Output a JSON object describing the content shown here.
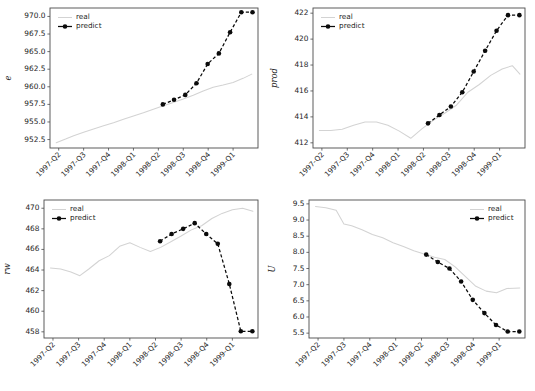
{
  "figure": {
    "background_color": "#ffffff",
    "real_color": "#d3d3d3",
    "predict_color": "#0b0b0b",
    "panel_count": 4
  },
  "legend": {
    "real_label": "real",
    "predict_label": "predict"
  },
  "chart_data": [
    {
      "id": "e",
      "type": "line",
      "title": "",
      "xlabel": "",
      "ylabel": "e",
      "grid": false,
      "legend_position": "upper left",
      "x": [
        "1997-Q2",
        "1997-Q3",
        "1997-Q4",
        "1998-Q1",
        "1998-Q2",
        "1998-Q3",
        "1998-Q4",
        "1999-Q1"
      ],
      "xtick_labels": [
        "1997-Q2",
        "1997-Q3",
        "1997-Q4",
        "1998-Q1",
        "1998-Q2",
        "1998-Q3",
        "1998-Q4",
        "1999-Q1"
      ],
      "ytick_labels": [
        "952.5",
        "955.0",
        "957.5",
        "960.0",
        "962.5",
        "965.0",
        "967.5",
        "970.0"
      ],
      "yticks": [
        952.5,
        955.0,
        957.5,
        960.0,
        962.5,
        965.0,
        967.5,
        970.0
      ],
      "ylim": [
        951.3,
        971.2
      ],
      "xlim": [
        -0.35,
        8.0
      ],
      "series": [
        {
          "name": "real",
          "style": "solid",
          "markers": false,
          "x": [
            -0.1,
            0.3,
            0.6,
            1.0,
            1.4,
            1.8,
            2.2,
            2.6,
            3.0,
            3.4,
            3.8,
            4.2,
            4.6,
            5.0,
            5.4,
            5.8,
            6.2,
            6.6,
            7.0,
            7.4,
            7.75
          ],
          "values": [
            952.05,
            952.6,
            953.05,
            953.55,
            954.0,
            954.45,
            954.9,
            955.4,
            955.85,
            956.3,
            956.8,
            957.3,
            957.75,
            958.25,
            958.8,
            959.4,
            959.95,
            960.25,
            960.6,
            961.2,
            961.8
          ]
        },
        {
          "name": "predict",
          "style": "dashed",
          "markers": true,
          "x": [
            4.18,
            4.63,
            5.08,
            5.53,
            5.98,
            6.43,
            6.88,
            7.33,
            7.78
          ],
          "values": [
            957.5,
            958.15,
            958.85,
            960.5,
            963.25,
            964.75,
            967.75,
            970.6,
            970.6
          ]
        }
      ]
    },
    {
      "id": "prod",
      "type": "line",
      "title": "",
      "xlabel": "",
      "ylabel": "prod",
      "grid": false,
      "legend_position": "upper left",
      "x": [
        "1997-Q2",
        "1997-Q3",
        "1997-Q4",
        "1998-Q1",
        "1998-Q2",
        "1998-Q3",
        "1998-Q4",
        "1999-Q1"
      ],
      "xtick_labels": [
        "1997-Q2",
        "1997-Q3",
        "1997-Q4",
        "1998-Q1",
        "1998-Q2",
        "1998-Q3",
        "1998-Q4",
        "1999-Q1"
      ],
      "ytick_labels": [
        "412",
        "414",
        "416",
        "418",
        "420",
        "422"
      ],
      "yticks": [
        412,
        414,
        416,
        418,
        420,
        422
      ],
      "ylim": [
        411.6,
        422.4
      ],
      "xlim": [
        -0.35,
        8.0
      ],
      "series": [
        {
          "name": "real",
          "style": "solid",
          "markers": false,
          "x": [
            -0.1,
            0.35,
            0.8,
            1.25,
            1.7,
            2.15,
            2.6,
            3.05,
            3.5,
            3.95,
            4.4,
            4.85,
            5.3,
            5.75,
            6.2,
            6.65,
            7.1,
            7.5,
            7.8
          ],
          "values": [
            412.95,
            412.95,
            413.05,
            413.35,
            413.6,
            413.6,
            413.35,
            412.9,
            412.35,
            413.1,
            413.75,
            414.3,
            414.9,
            415.9,
            416.5,
            417.2,
            417.7,
            417.95,
            417.3
          ]
        },
        {
          "name": "predict",
          "style": "dashed",
          "markers": true,
          "x": [
            4.18,
            4.63,
            5.08,
            5.53,
            5.98,
            6.43,
            6.88,
            7.33,
            7.78
          ],
          "values": [
            413.5,
            414.15,
            414.8,
            415.9,
            417.5,
            419.1,
            420.65,
            421.85,
            421.85
          ]
        }
      ]
    },
    {
      "id": "rw",
      "type": "line",
      "title": "",
      "xlabel": "",
      "ylabel": "rw",
      "grid": false,
      "legend_position": "upper left",
      "x": [
        "1997-Q2",
        "1997-Q3",
        "1997-Q4",
        "1998-Q1",
        "1998-Q2",
        "1998-Q3",
        "1998-Q4",
        "1999-Q1"
      ],
      "xtick_labels": [
        "1997-Q2",
        "1997-Q3",
        "1997-Q4",
        "1998-Q1",
        "1998-Q2",
        "1998-Q3",
        "1998-Q4",
        "1999-Q1"
      ],
      "ytick_labels": [
        "458",
        "460",
        "462",
        "464",
        "466",
        "468",
        "470"
      ],
      "yticks": [
        458,
        460,
        462,
        464,
        466,
        468,
        470
      ],
      "ylim": [
        457.4,
        470.8
      ],
      "xlim": [
        -0.35,
        8.0
      ],
      "series": [
        {
          "name": "real",
          "style": "solid",
          "markers": false,
          "x": [
            -0.1,
            0.3,
            0.7,
            1.05,
            1.4,
            1.8,
            2.2,
            2.6,
            3.0,
            3.4,
            3.8,
            4.2,
            4.6,
            5.0,
            5.4,
            5.8,
            6.2,
            6.6,
            7.0,
            7.4,
            7.8
          ],
          "values": [
            464.2,
            464.1,
            463.8,
            463.45,
            464.1,
            464.9,
            465.4,
            466.3,
            466.65,
            466.2,
            465.8,
            466.2,
            466.75,
            467.3,
            467.9,
            468.3,
            469.0,
            469.5,
            469.85,
            470.0,
            469.7
          ]
        },
        {
          "name": "predict",
          "style": "dashed",
          "markers": true,
          "x": [
            4.18,
            4.63,
            5.08,
            5.53,
            5.98,
            6.43,
            6.88,
            7.33,
            7.78
          ],
          "values": [
            466.8,
            467.5,
            468.0,
            468.55,
            467.5,
            466.55,
            462.65,
            458.05,
            458.05
          ]
        }
      ]
    },
    {
      "id": "U",
      "type": "line",
      "title": "",
      "xlabel": "",
      "ylabel": "U",
      "grid": false,
      "legend_position": "upper right",
      "x": [
        "1997-Q2",
        "1997-Q3",
        "1997-Q4",
        "1998-Q1",
        "1998-Q2",
        "1998-Q3",
        "1998-Q4",
        "1999-Q1"
      ],
      "xtick_labels": [
        "1997-Q2",
        "1997-Q3",
        "1997-Q4",
        "1998-Q1",
        "1998-Q2",
        "1998-Q3",
        "1998-Q4",
        "1999-Q1"
      ],
      "ytick_labels": [
        "5.5",
        "6.0",
        "6.5",
        "7.0",
        "7.5",
        "8.0",
        "8.5",
        "9.0",
        "9.5"
      ],
      "yticks": [
        5.5,
        6.0,
        6.5,
        7.0,
        7.5,
        8.0,
        8.5,
        9.0,
        9.5
      ],
      "ylim": [
        5.35,
        9.62
      ],
      "xlim": [
        -0.35,
        8.0
      ],
      "series": [
        {
          "name": "real",
          "style": "solid",
          "markers": false,
          "x": [
            -0.1,
            0.3,
            0.7,
            1.0,
            1.3,
            1.7,
            2.1,
            2.5,
            2.9,
            3.3,
            3.7,
            4.1,
            4.5,
            4.9,
            5.3,
            5.7,
            6.1,
            6.5,
            6.9,
            7.3,
            7.8
          ],
          "values": [
            9.42,
            9.38,
            9.3,
            8.88,
            8.82,
            8.7,
            8.55,
            8.45,
            8.3,
            8.18,
            8.05,
            7.95,
            7.85,
            7.78,
            7.55,
            7.25,
            6.95,
            6.8,
            6.75,
            6.88,
            6.9
          ]
        },
        {
          "name": "predict",
          "style": "dashed",
          "markers": true,
          "x": [
            4.18,
            4.63,
            5.08,
            5.53,
            5.98,
            6.43,
            6.88,
            7.33,
            7.78
          ],
          "values": [
            7.93,
            7.7,
            7.5,
            7.1,
            6.53,
            6.12,
            5.75,
            5.55,
            5.55
          ]
        }
      ]
    }
  ]
}
